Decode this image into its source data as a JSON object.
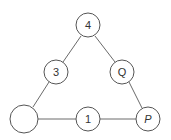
{
  "diagram": {
    "type": "triangle-node-graph",
    "nodes": [
      {
        "id": "top",
        "label": "4",
        "cx": 88,
        "cy": 25,
        "r": 12
      },
      {
        "id": "left-mid",
        "label": "3",
        "cx": 56,
        "cy": 72,
        "r": 12
      },
      {
        "id": "right-mid",
        "label": "Q",
        "cx": 122,
        "cy": 72,
        "r": 12
      },
      {
        "id": "bottom-left",
        "label": "",
        "cx": 24,
        "cy": 119,
        "r": 14
      },
      {
        "id": "bottom-mid",
        "label": "1",
        "cx": 88,
        "cy": 119,
        "r": 12
      },
      {
        "id": "bottom-right",
        "label": "P",
        "cx": 148,
        "cy": 119,
        "r": 12
      }
    ],
    "edges": [
      [
        "top",
        "left-mid"
      ],
      [
        "left-mid",
        "bottom-left"
      ],
      [
        "top",
        "right-mid"
      ],
      [
        "right-mid",
        "bottom-right"
      ],
      [
        "bottom-left",
        "bottom-mid"
      ],
      [
        "bottom-mid",
        "bottom-right"
      ]
    ]
  }
}
